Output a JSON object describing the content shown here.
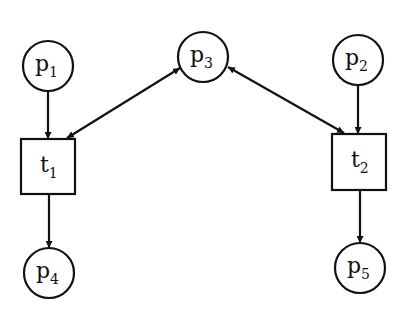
{
  "diagram": {
    "type": "petri-net",
    "places": [
      {
        "id": "p1",
        "label": "p",
        "sub": "1",
        "cx": 48,
        "cy": 66
      },
      {
        "id": "p2",
        "label": "p",
        "sub": "2",
        "cx": 358,
        "cy": 60
      },
      {
        "id": "p3",
        "label": "p",
        "sub": "3",
        "cx": 203,
        "cy": 57
      },
      {
        "id": "p4",
        "label": "p",
        "sub": "4",
        "cx": 49,
        "cy": 273
      },
      {
        "id": "p5",
        "label": "p",
        "sub": "5",
        "cx": 360,
        "cy": 268
      }
    ],
    "transitions": [
      {
        "id": "t1",
        "label": "t",
        "sub": "1",
        "x": 21,
        "y": 139,
        "w": 54,
        "h": 55
      },
      {
        "id": "t2",
        "label": "t",
        "sub": "2",
        "x": 332,
        "y": 134,
        "w": 54,
        "h": 56
      }
    ],
    "arcs": [
      {
        "from": "p1",
        "to": "t1"
      },
      {
        "from": "p3",
        "to": "t1",
        "bidirectional": true
      },
      {
        "from": "p3",
        "to": "t2",
        "bidirectional": true
      },
      {
        "from": "p2",
        "to": "t2"
      },
      {
        "from": "t1",
        "to": "p4"
      },
      {
        "from": "t2",
        "to": "p5"
      }
    ]
  }
}
